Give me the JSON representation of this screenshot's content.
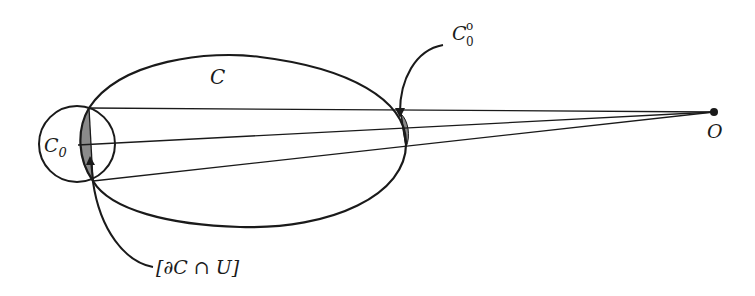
{
  "figure": {
    "labels": {
      "curve": "C",
      "circle": "C",
      "circle_sub": "0",
      "shaded_far": "C",
      "shaded_far_sup": "o",
      "shaded_far_sub": "0",
      "boundary_part": "[∂C ∩ U]",
      "point": "O"
    },
    "colors": {
      "stroke": "#1a1a1a",
      "shade": "#8a8a8a",
      "background": "#ffffff"
    }
  }
}
